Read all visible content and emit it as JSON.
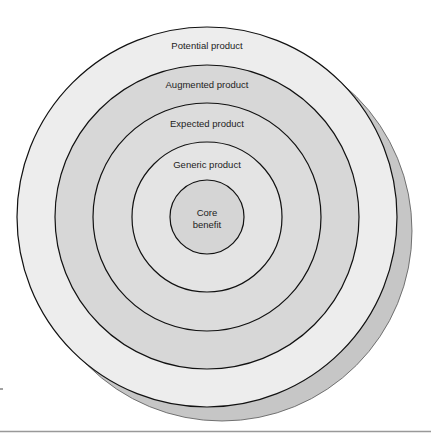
{
  "diagram": {
    "type": "concentric-rings",
    "center": {
      "x": 207,
      "y": 217
    },
    "shadow": {
      "dx": 15,
      "dy": 14,
      "fill": "#c6c6c6"
    },
    "rings": [
      {
        "label": "Potential product",
        "r": 190,
        "fill": "#ededed",
        "label_y": 46
      },
      {
        "label": "Augmented product",
        "r": 152,
        "fill": "#d7d7d7",
        "label_y": 88
      },
      {
        "label": "Expected product",
        "r": 114,
        "fill": "#dcdcdc",
        "label_y": 127
      },
      {
        "label": "Generic product",
        "r": 75,
        "fill": "#e4e4e4",
        "label_y": 168
      },
      {
        "label_line1": "Core",
        "label_line2": "benefit",
        "r": 37,
        "fill": "#d5d5d5",
        "label_y": 213
      }
    ]
  }
}
